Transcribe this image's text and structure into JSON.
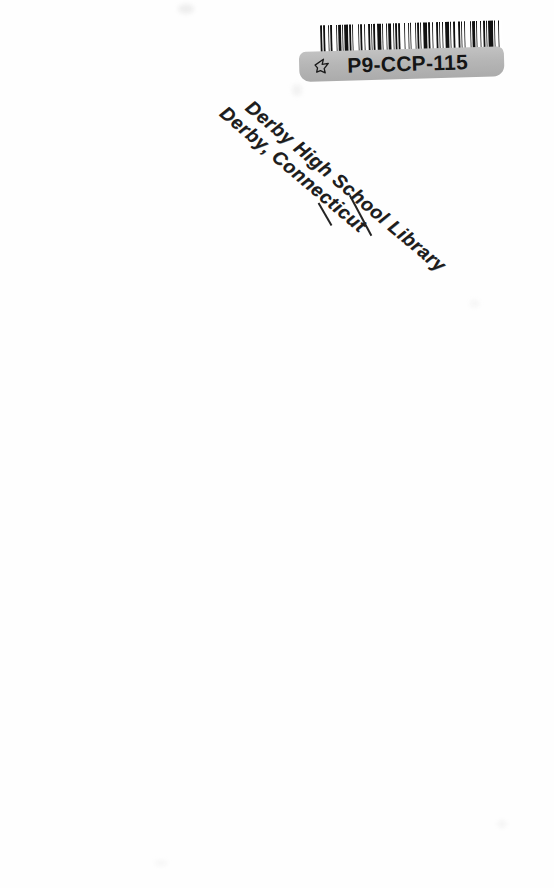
{
  "page": {
    "kind": "scanned-book-page",
    "background_color": "#fefefe",
    "width": 554,
    "height": 888
  },
  "barcode_label": {
    "code": "P9-CCP-115",
    "icon": "hand-pointer-icon",
    "plate_color": "#b6b6b6",
    "bar_color": "#111111",
    "bar_widths": [
      2,
      1,
      1,
      3,
      1,
      1,
      1,
      4,
      1,
      1,
      2,
      1,
      1,
      1,
      3,
      1,
      2,
      1,
      1,
      4,
      1,
      1,
      1,
      2,
      1,
      3,
      1,
      1,
      1,
      1,
      2,
      1,
      4,
      1,
      1,
      2,
      1,
      1,
      3,
      1,
      1,
      1,
      2,
      1,
      1,
      4,
      1,
      2,
      1,
      1,
      1,
      3,
      1,
      1,
      2,
      1,
      1,
      1,
      4,
      1,
      1,
      2,
      1,
      3,
      1,
      1,
      1,
      2,
      1,
      1,
      4,
      1,
      1,
      1,
      2,
      3,
      1,
      1,
      1,
      2,
      1,
      4,
      1,
      1,
      2,
      1,
      1,
      3,
      1,
      1,
      2,
      1,
      1,
      1,
      4,
      1,
      1,
      2,
      1,
      3
    ]
  },
  "library_stamp": {
    "line1": "Derby High School Library",
    "line2": "Derby, Connecticut",
    "ink_color": "#1d1d1d",
    "rotation_degrees": 40
  }
}
